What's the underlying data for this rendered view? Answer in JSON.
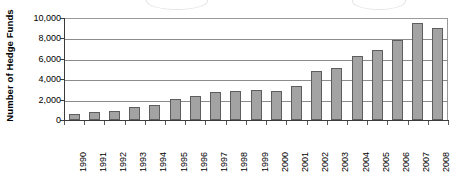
{
  "chart_data": {
    "type": "bar",
    "title": "",
    "subtitle": "",
    "xlabel": "",
    "ylabel": "Number of Hedge Funds",
    "ylim": [
      0,
      10000
    ],
    "ytick_step": 2000,
    "ytick_labels": [
      "0",
      "2,000",
      "4,000",
      "6,000",
      "8,000",
      "10,000"
    ],
    "ytick_values": [
      0,
      2000,
      4000,
      6000,
      8000,
      10000
    ],
    "grid": true,
    "grid_axis": "y",
    "legend": false,
    "legend_position": "none",
    "bar_color": "#a3a3a3",
    "bar_border_color": "#5d5d5d",
    "categories": [
      "1990",
      "1991",
      "1992",
      "1993",
      "1994",
      "1995",
      "1996",
      "1997",
      "1998",
      "1999",
      "2000",
      "2001",
      "2002",
      "2003",
      "2004",
      "2005",
      "2006",
      "2007",
      "2008"
    ],
    "values": [
      610,
      760,
      900,
      1300,
      1500,
      2100,
      2400,
      2700,
      2850,
      2900,
      2850,
      3300,
      4800,
      5100,
      6300,
      6900,
      7800,
      9500,
      9000
    ]
  }
}
